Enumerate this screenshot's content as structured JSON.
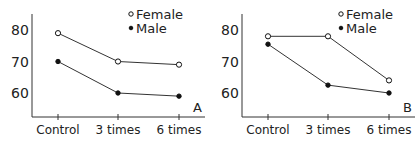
{
  "chart_data": [
    {
      "type": "line",
      "panel_label": "A",
      "categories": [
        "Control",
        "3 times",
        "6 times"
      ],
      "series": [
        {
          "name": "Female",
          "marker": "open-circle",
          "values": [
            79,
            70,
            69
          ]
        },
        {
          "name": "Male",
          "marker": "filled-circle",
          "values": [
            70,
            60,
            59
          ]
        }
      ],
      "yticks": [
        60,
        70,
        80
      ],
      "ylim": [
        52,
        85
      ],
      "xlabel": "",
      "ylabel": "",
      "legend_position": "top-right",
      "grid": false
    },
    {
      "type": "line",
      "panel_label": "B",
      "categories": [
        "Control",
        "3 times",
        "6 times"
      ],
      "series": [
        {
          "name": "Female",
          "marker": "open-circle",
          "values": [
            78,
            78,
            64
          ]
        },
        {
          "name": "Male",
          "marker": "filled-circle",
          "values": [
            75.5,
            62.5,
            60
          ]
        }
      ],
      "yticks": [
        60,
        70,
        80
      ],
      "ylim": [
        52,
        85
      ],
      "xlabel": "",
      "ylabel": "",
      "legend_position": "top-right",
      "grid": false
    }
  ],
  "colors": {
    "line": "#333333",
    "text": "#222222"
  }
}
